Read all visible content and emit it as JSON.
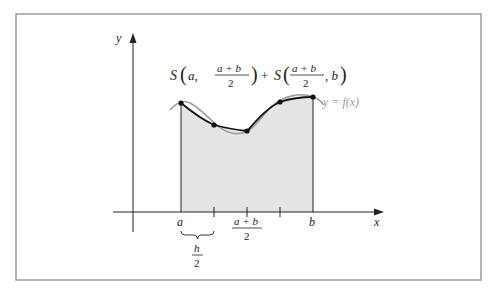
{
  "figure": {
    "formula": {
      "left": {
        "S": "S",
        "arg1": "a,",
        "num": "a + b",
        "den": "2"
      },
      "plus": "+",
      "right": {
        "S": "S",
        "num": "a + b",
        "den": "2",
        "arg2": ", b"
      }
    },
    "axes": {
      "y_label": "y",
      "x_label": "x"
    },
    "curve_label": "y = f(x)",
    "tick_labels": {
      "a": "a",
      "mid_num": "a + b",
      "mid_den": "2",
      "b": "b"
    },
    "brace_label": {
      "num": "h",
      "den": "2"
    },
    "colors": {
      "frame": "#9a9a9a",
      "fill": "#e6e6e6",
      "curve": "#999999",
      "approx": "#111111"
    }
  }
}
